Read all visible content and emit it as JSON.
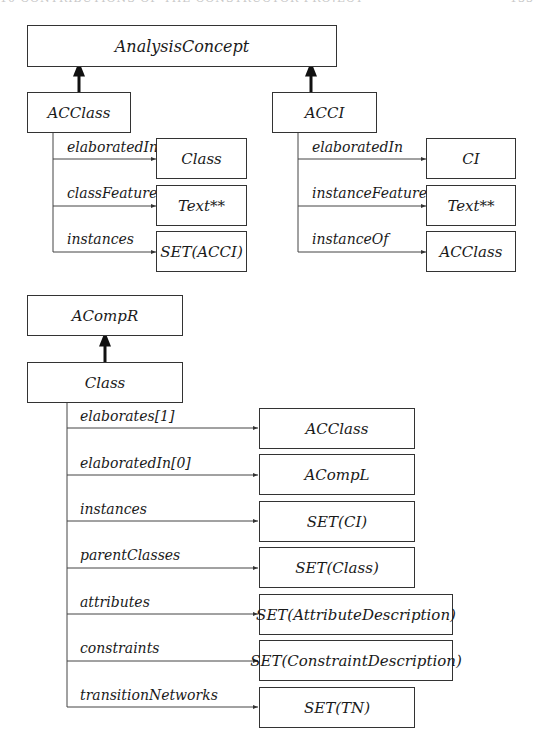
{
  "page_header": {
    "left": "10 CONTRIBUTIONS OF THE CONSTRUCTOR PROJECT",
    "right": "133"
  },
  "diagram1": {
    "root": "AnalysisConcept",
    "left_node": {
      "name": "ACClass",
      "relations": [
        {
          "label": "elaboratedIn",
          "target": "Class"
        },
        {
          "label": "classFeatures",
          "target": "Text**"
        },
        {
          "label": "instances",
          "target": "SET(ACCI)"
        }
      ]
    },
    "right_node": {
      "name": "ACCI",
      "relations": [
        {
          "label": "elaboratedIn",
          "target": "CI"
        },
        {
          "label": "instanceFeatures",
          "target": "Text**"
        },
        {
          "label": "instanceOf",
          "target": "ACClass"
        }
      ]
    }
  },
  "diagram2": {
    "root": "ACompR",
    "node": {
      "name": "Class",
      "relations": [
        {
          "label": "elaborates[1]",
          "target": "ACClass"
        },
        {
          "label": "elaboratedIn[0]",
          "target": "ACompL"
        },
        {
          "label": "instances",
          "target": "SET(CI)"
        },
        {
          "label": "parentClasses",
          "target": "SET(Class)"
        },
        {
          "label": "attributes",
          "target": "SET(AttributeDescription)"
        },
        {
          "label": "constraints",
          "target": "SET(ConstraintDescription)"
        },
        {
          "label": "transitionNetworks",
          "target": "SET(TN)"
        }
      ]
    }
  }
}
